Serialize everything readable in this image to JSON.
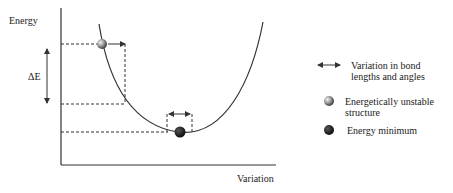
{
  "axes": {
    "y_label": "Energy",
    "x_label": "Variation",
    "delta_label": "ΔE"
  },
  "legend": [
    {
      "icon": "double-arrow-icon",
      "text_line1": "Variation in bond",
      "text_line2": "lengths and angles"
    },
    {
      "icon": "gray-sphere-icon",
      "text_line1": "Energetically unstable",
      "text_line2": "structure"
    },
    {
      "icon": "black-sphere-icon",
      "text_line1": "Energy minimum",
      "text_line2": ""
    }
  ],
  "colors": {
    "line": "#333333",
    "sphere_unstable": "#9a9a9a",
    "sphere_minimum": "#111111"
  }
}
